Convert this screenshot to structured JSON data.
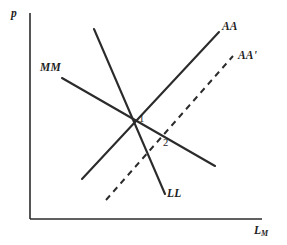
{
  "figure": {
    "background_color": "#ffffff",
    "ink_color": "#2b2b2b",
    "width": 287,
    "height": 245
  },
  "axes": {
    "y_label": "p",
    "x_label": "L",
    "x_label_subscript": "M",
    "origin": {
      "x": 30,
      "y": 219
    },
    "y_top": {
      "x": 30,
      "y": 13
    },
    "x_right": {
      "x": 262,
      "y": 219
    }
  },
  "curves": [
    {
      "id": "MM",
      "label": "MM",
      "style": "solid",
      "label_x": 40,
      "label_y": 62,
      "x1": 62,
      "y1": 78,
      "x2": 215,
      "y2": 166
    },
    {
      "id": "LL",
      "label": "LL",
      "style": "solid",
      "label_x": 167,
      "label_y": 188,
      "x1": 94,
      "y1": 29,
      "x2": 165,
      "y2": 194
    },
    {
      "id": "AA",
      "label": "AA",
      "style": "solid",
      "label_x": 222,
      "label_y": 21,
      "x1": 82,
      "y1": 179,
      "x2": 219,
      "y2": 32
    },
    {
      "id": "AAprime",
      "label": "AA'",
      "style": "dashed",
      "label_x": 238,
      "label_y": 50,
      "x1": 106,
      "y1": 200,
      "x2": 233,
      "y2": 56
    }
  ],
  "points": [
    {
      "id": "equilibrium-1",
      "label": "1",
      "x": 139,
      "y": 114
    },
    {
      "id": "equilibrium-2",
      "label": "2",
      "x": 163,
      "y": 138
    }
  ],
  "chart_data": {
    "type": "line",
    "title": "",
    "xlabel": "L_M",
    "ylabel": "p",
    "grid": false,
    "legend": "inline-curve-labels",
    "series": [
      {
        "name": "MM",
        "style": "solid",
        "slope": "negative-shallow",
        "points": [
          [
            62,
            78
          ],
          [
            215,
            166
          ]
        ]
      },
      {
        "name": "LL",
        "style": "solid",
        "slope": "negative-steep",
        "points": [
          [
            94,
            29
          ],
          [
            165,
            194
          ]
        ]
      },
      {
        "name": "AA",
        "style": "solid",
        "slope": "positive",
        "points": [
          [
            82,
            179
          ],
          [
            219,
            32
          ]
        ]
      },
      {
        "name": "AA'",
        "style": "dashed",
        "slope": "positive",
        "points": [
          [
            106,
            200
          ],
          [
            233,
            56
          ]
        ]
      }
    ],
    "annotations": [
      {
        "text": "1",
        "x": 139,
        "y": 114
      },
      {
        "text": "2",
        "x": 163,
        "y": 138
      }
    ]
  }
}
